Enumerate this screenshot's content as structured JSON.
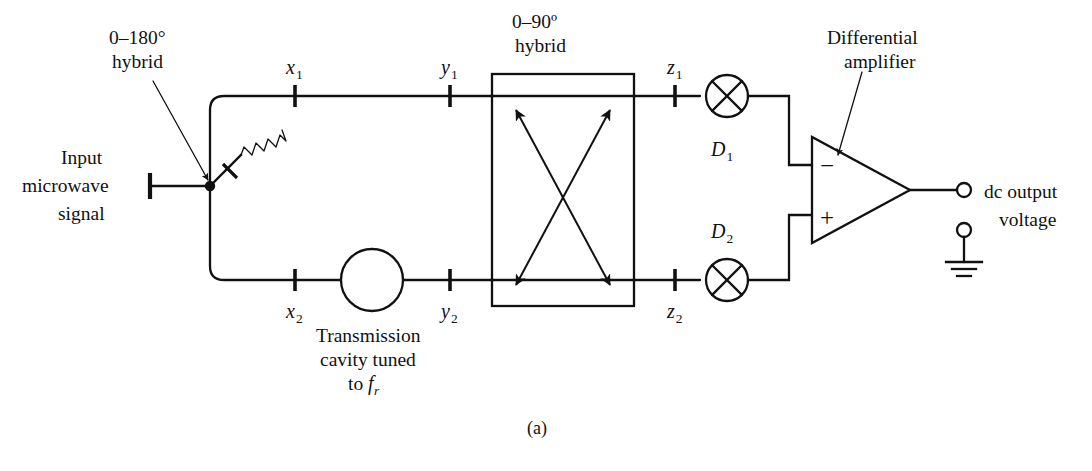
{
  "figure": {
    "caption": "(a)",
    "title_inferred": "Microwave frequency discriminator block diagram"
  },
  "labels": {
    "hybrid_180": {
      "line1": "0–180°",
      "line2": "hybrid"
    },
    "hybrid_90": {
      "line1": "0–90º",
      "line2": "hybrid"
    },
    "input": {
      "line1": "Input",
      "line2": "microwave",
      "line3": "signal"
    },
    "diff_amp": {
      "line1": "Differential",
      "line2": "amplifier"
    },
    "output": {
      "line1": "dc output",
      "line2": "voltage"
    },
    "cavity": {
      "line1": "Transmission",
      "line2": "cavity tuned",
      "line3_pre": "to ",
      "line3_math": "f",
      "line3_sub": "r"
    },
    "amp_minus": "−",
    "amp_plus": "+"
  },
  "nodes": [
    {
      "id": "x1",
      "base": "x",
      "sub": "1"
    },
    {
      "id": "x2",
      "base": "x",
      "sub": "2"
    },
    {
      "id": "y1",
      "base": "y",
      "sub": "1"
    },
    {
      "id": "y2",
      "base": "y",
      "sub": "2"
    },
    {
      "id": "z1",
      "base": "z",
      "sub": "1"
    },
    {
      "id": "z2",
      "base": "z",
      "sub": "2"
    }
  ],
  "detectors": [
    {
      "id": "D1",
      "base": "D",
      "sub": "1"
    },
    {
      "id": "D2",
      "base": "D",
      "sub": "2"
    }
  ],
  "colors": {
    "ink": "#111111",
    "background": "#ffffff"
  }
}
